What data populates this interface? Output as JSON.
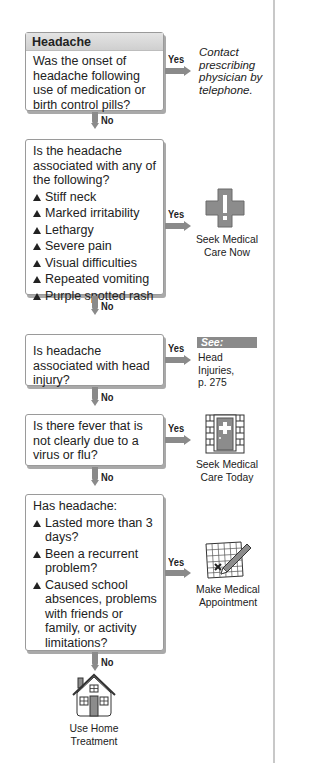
{
  "flowchart": {
    "title": "Headache",
    "colors": {
      "arrow": "#8a8a8a",
      "box_border": "#9a9a9a",
      "icon_fill": "#8c8c8c",
      "see_badge": "#8a8a8a"
    },
    "steps": [
      {
        "question": "Was the onset of headache following use of medication or birth control pills?",
        "yes_label": "Yes",
        "no_label": "No",
        "yes_outcome": {
          "text": "Contact prescribing physician by telephone.",
          "style": "italic"
        }
      },
      {
        "question": "Is the headache associated with any of the following?",
        "items": [
          "Stiff neck",
          "Marked irritability",
          "Lethargy",
          "Severe pain",
          "Visual difficulties",
          "Repeated vomiting",
          "Purple spotted rash"
        ],
        "yes_label": "Yes",
        "no_label": "No",
        "yes_outcome": {
          "text_line1": "Seek Medical",
          "text_line2": "Care Now",
          "icon": "medical-cross-exclamation-icon"
        }
      },
      {
        "question": "Is headache associated with head injury?",
        "yes_label": "Yes",
        "no_label": "No",
        "yes_outcome": {
          "see_label": "See:",
          "ref_line1": "Head",
          "ref_line2": "Injuries,",
          "ref_line3": "p. 275"
        }
      },
      {
        "question": "Is there fever that is not clearly due to a virus or flu?",
        "yes_label": "Yes",
        "no_label": "No",
        "yes_outcome": {
          "text_line1": "Seek Medical",
          "text_line2": "Care Today",
          "icon": "clinic-door-icon"
        }
      },
      {
        "question": "Has headache:",
        "items": [
          "Lasted more than 3 days?",
          "Been a recurrent problem?",
          "Caused school absences, problems with friends or family, or activity limitations?"
        ],
        "yes_label": "Yes",
        "no_label": "No",
        "yes_outcome": {
          "text_line1": "Make Medical",
          "text_line2": "Appointment",
          "icon": "calendar-pencil-icon"
        },
        "no_outcome": {
          "text_line1": "Use Home",
          "text_line2": "Treatment",
          "icon": "house-icon"
        }
      }
    ]
  }
}
